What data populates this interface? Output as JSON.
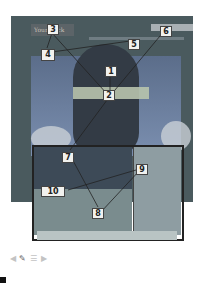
{
  "page": {
    "logo_text": "Your Lock"
  },
  "callouts": [
    {
      "id": "1",
      "label": "1"
    },
    {
      "id": "2",
      "label": "2"
    },
    {
      "id": "3",
      "label": "3"
    },
    {
      "id": "4",
      "label": "4"
    },
    {
      "id": "5",
      "label": "5"
    },
    {
      "id": "6",
      "label": "6"
    },
    {
      "id": "7",
      "label": "7"
    },
    {
      "id": "8",
      "label": "8"
    },
    {
      "id": "9",
      "label": "9"
    },
    {
      "id": "10",
      "label": "10"
    }
  ],
  "toolbar": {
    "icons": [
      "back-arrow-icon",
      "pencil-icon",
      "list-icon",
      "forward-arrow-icon"
    ]
  },
  "colors": {
    "background": "#ffffff",
    "screenshot_frame": "#4a5a5e",
    "callout_fill": "#f1f1ee",
    "callout_border": "#444444"
  }
}
